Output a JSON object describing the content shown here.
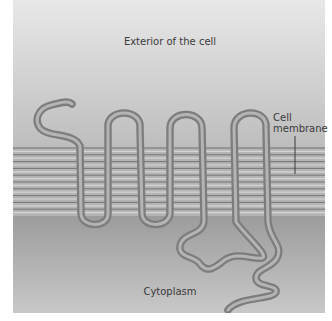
{
  "diagram": {
    "regions": {
      "exterior": {
        "label": "Exterior of the cell"
      },
      "membrane": {
        "label_line1": "Cell",
        "label_line2": "membrane"
      },
      "cytoplasm": {
        "label": "Cytoplasm"
      }
    },
    "protein": {
      "membrane_crossings": 7,
      "extracellular_loops": 3,
      "intracellular_loops": 3
    },
    "colors": {
      "exterior_top": "#e8e8e8",
      "exterior_bottom": "#bdbdbd",
      "membrane_dark_line": "#6e6e6e",
      "membrane_light_line": "#d4d4d4",
      "cytoplasm_top": "#9c9c9c",
      "cytoplasm_bottom": "#c8c8c8",
      "protein_outline": "#7d7d7d",
      "protein_highlight": "#b4b4b4",
      "label_text": "#3a3a3a"
    }
  }
}
